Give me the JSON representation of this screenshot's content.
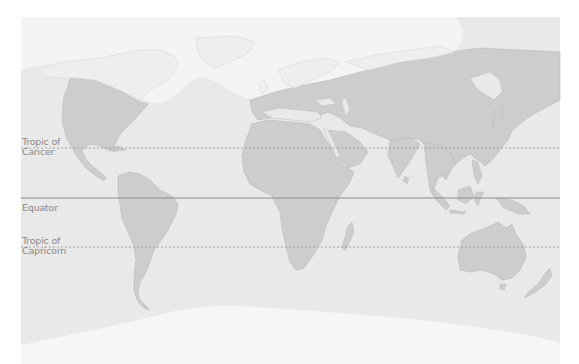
{
  "map": {
    "title": "World map with latitude lines",
    "colors": {
      "page_background": "#ffffff",
      "ocean": "#e9e9e9",
      "land": "#cdcdcd",
      "northern_zone": "#f4f4f4",
      "northern_land": "#eeeeee",
      "southern_zone": "#f6f6f6",
      "equator_line": "#8c8c8c",
      "tropic_line": "#9a9a9a",
      "label_text": "#8a8a8a"
    },
    "latitude_lines": [
      {
        "name": "tropic-of-cancer",
        "label_line1": "Tropic of",
        "label_line2": "Cancer",
        "y": 148,
        "style": "dashed"
      },
      {
        "name": "equator",
        "label_line1": "Equator",
        "label_line2": "",
        "y": 198,
        "style": "solid"
      },
      {
        "name": "tropic-of-capricorn",
        "label_line1": "Tropic of",
        "label_line2": "Capricorn",
        "y": 247,
        "style": "dashed"
      }
    ],
    "continents": [
      "North America",
      "South America",
      "Europe",
      "Africa",
      "Asia",
      "Australia",
      "Greenland",
      "Antarctica"
    ]
  }
}
